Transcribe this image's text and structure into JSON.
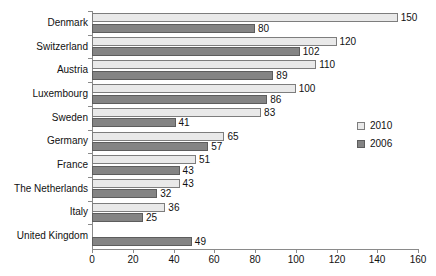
{
  "chart_data": {
    "type": "bar",
    "orientation": "horizontal",
    "title": "",
    "xlabel": "",
    "ylabel": "",
    "xlim": [
      0,
      160
    ],
    "xticks": [
      0,
      20,
      40,
      60,
      80,
      100,
      120,
      140,
      160
    ],
    "grid": false,
    "legend_position": "right",
    "categories": [
      "Denmark",
      "Switzerland",
      "Austria",
      "Luxembourg",
      "Sweden",
      "Germany",
      "France",
      "The Netherlands",
      "Italy",
      "United Kingdom"
    ],
    "series": [
      {
        "name": "2010",
        "color": "#e9e9e9",
        "values": [
          150,
          120,
          110,
          100,
          83,
          65,
          51,
          43,
          36,
          null
        ],
        "labels": [
          "150",
          "120",
          "110",
          "100",
          "83",
          "65",
          "51",
          "43",
          "36",
          ""
        ]
      },
      {
        "name": "2006",
        "color": "#848484",
        "values": [
          80,
          102,
          89,
          86,
          41,
          57,
          43,
          32,
          25,
          49
        ],
        "labels": [
          "80",
          "102",
          "89",
          "86",
          "41",
          "57",
          "43",
          "32",
          "25",
          "49"
        ]
      }
    ]
  },
  "legend": {
    "entries": [
      {
        "label": "2010"
      },
      {
        "label": "2006"
      }
    ]
  },
  "colors": {
    "series_2010": "#e9e9e9",
    "series_2006": "#848484",
    "axis": "#8a8a8a",
    "text": "#111111",
    "background": "#ffffff"
  }
}
